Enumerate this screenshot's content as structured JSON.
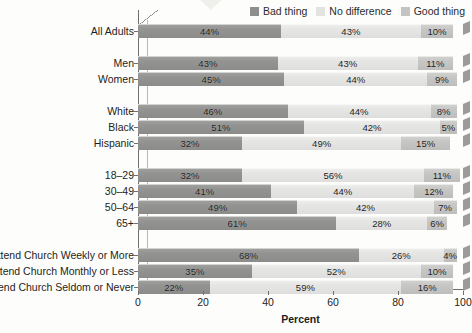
{
  "legend": {
    "items": [
      {
        "label": "Bad thing",
        "color": "#8e8e8e",
        "key": "bad"
      },
      {
        "label": "No difference",
        "color": "#e3e3e1",
        "key": "nodiff"
      },
      {
        "label": "Good thing",
        "color": "#c3c3c1",
        "key": "good"
      }
    ]
  },
  "axis": {
    "xlabel": "Percent",
    "ticks": [
      "0",
      "20",
      "40",
      "60",
      "80",
      "100"
    ]
  },
  "chart_data": {
    "type": "bar",
    "orientation": "horizontal",
    "stacked": true,
    "title": "",
    "xlabel": "Percent",
    "ylabel": "",
    "xlim": [
      0,
      100
    ],
    "xticks": [
      0,
      20,
      40,
      60,
      80,
      100
    ],
    "grid": false,
    "legend_position": "top-right",
    "value_suffix": "%",
    "categories": [
      "All Adults",
      "Men",
      "Women",
      "White",
      "Black",
      "Hispanic",
      "18–29",
      "30–49",
      "50–64",
      "65+",
      "Attend Church Weekly or More",
      "Attend Church Monthly or Less",
      "Attend Church Seldom or Never"
    ],
    "groups": [
      {
        "name": "All Adults",
        "categories": [
          "All Adults"
        ]
      },
      {
        "name": "Gender",
        "categories": [
          "Men",
          "Women"
        ]
      },
      {
        "name": "Race",
        "categories": [
          "White",
          "Black",
          "Hispanic"
        ]
      },
      {
        "name": "Age",
        "categories": [
          "18–29",
          "30–49",
          "50–64",
          "65+"
        ]
      },
      {
        "name": "Church Attendance",
        "categories": [
          "Attend Church Weekly or More",
          "Attend Church Monthly or Less",
          "Attend Church Seldom or Never"
        ]
      }
    ],
    "series": [
      {
        "name": "Bad thing",
        "color": "#8e8e8e",
        "values": [
          44,
          43,
          45,
          46,
          51,
          32,
          32,
          41,
          49,
          61,
          68,
          35,
          22
        ]
      },
      {
        "name": "No difference",
        "color": "#e3e3e1",
        "values": [
          43,
          43,
          44,
          44,
          42,
          49,
          56,
          44,
          42,
          28,
          26,
          52,
          59
        ]
      },
      {
        "name": "Good thing",
        "color": "#c3c3c1",
        "values": [
          10,
          11,
          9,
          8,
          5,
          15,
          11,
          12,
          7,
          6,
          4,
          10,
          16
        ]
      }
    ],
    "labels": {
      "bad": [
        "44%",
        "43%",
        "45%",
        "46%",
        "51%",
        "32%",
        "32%",
        "41%",
        "49%",
        "61%",
        "68%",
        "35%",
        "22%"
      ],
      "nodiff": [
        "43%",
        "43%",
        "44%",
        "44%",
        "42%",
        "49%",
        "56%",
        "44%",
        "42%",
        "28%",
        "26%",
        "52%",
        "59%"
      ],
      "good": [
        "10%",
        "11%",
        "9%",
        "8%",
        "5%",
        "15%",
        "11%",
        "12%",
        "7%",
        "6%",
        "4%",
        "10%",
        "16%"
      ]
    }
  }
}
